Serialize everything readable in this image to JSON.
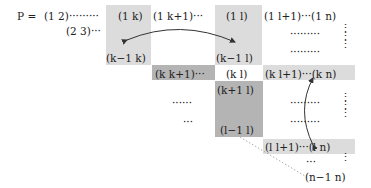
{
  "lhs": "P =",
  "row1": {
    "first": "(1 2)·········",
    "c1k": "(1 k)",
    "c1k1": "(1 k+1)···",
    "c1l": "(1 l)",
    "c1l1": "(1 l+1)···(1 n)"
  },
  "row2": {
    "first": "(2 3)···"
  },
  "rowk1": {
    "ck1k": "(k−1 k)",
    "ck1l": "(k−1 l)"
  },
  "rowk": {
    "ckk1": "(k k+1)···",
    "ckl": "(k l)",
    "ckl1": "(k l+1)···(k n)"
  },
  "rowk1p": {
    "ck1pl": "(k+1 l)"
  },
  "rowl1": {
    "cl1l": "(l−1 l)"
  },
  "rowl": {
    "cll1": "(l l+1)···(l n)"
  },
  "rown1": {
    "cn1n": "(n−1 n)"
  },
  "dots": {
    "h6": "······",
    "h3": "···",
    "h9": "·········",
    "v": "⋮"
  },
  "colors": {
    "light_shade": "#dcdcdc",
    "dark_shade": "#b4b4b4",
    "arrow": "#333333"
  }
}
